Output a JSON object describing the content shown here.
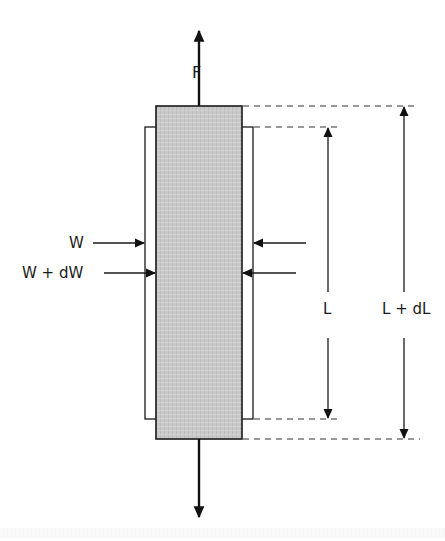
{
  "diagram": {
    "labels": {
      "force": "F",
      "width_original": "W",
      "width_deformed": "W + dW",
      "length_original": "L",
      "length_deformed": "L + dL"
    },
    "colors": {
      "stroke": "#1a1a1a",
      "specimen_fill": "#c8c8c8",
      "dash": "#333333",
      "background": "#ffffff"
    },
    "geometry": {
      "deformed_specimen": {
        "x1": 156,
        "y1": 106,
        "x2": 242,
        "y2": 439
      },
      "original_outline": {
        "x1": 145,
        "y1": 127,
        "x2": 253,
        "y2": 419
      },
      "force_axis_x": 199,
      "top_arrow": {
        "from_y": 106,
        "to_y": 30
      },
      "bottom_arrow": {
        "from_y": 439,
        "to_y": 517
      },
      "L_dimension_x": 328,
      "LdL_dimension_x": 404
    }
  }
}
